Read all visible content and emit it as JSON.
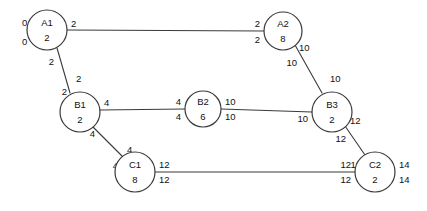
{
  "diagram": {
    "title": "",
    "type": "node-link-graph",
    "background_color": "#ffffff",
    "stroke_color": "#3a3a3a",
    "text_color": "#111111",
    "nodes": [
      {
        "id": "A1",
        "name": "A1",
        "value": "2",
        "cx": 47,
        "cy": 30,
        "r": 20
      },
      {
        "id": "A2",
        "name": "A2",
        "value": "8",
        "cx": 283,
        "cy": 31,
        "r": 19
      },
      {
        "id": "B1",
        "name": "B1",
        "value": "2",
        "cx": 80,
        "cy": 112,
        "r": 20
      },
      {
        "id": "B2",
        "name": "B2",
        "value": "6",
        "cx": 203,
        "cy": 109,
        "r": 18
      },
      {
        "id": "B3",
        "name": "B3",
        "value": "2",
        "cx": 332,
        "cy": 112,
        "r": 20
      },
      {
        "id": "C1",
        "name": "C1",
        "value": "8",
        "cx": 135,
        "cy": 172,
        "r": 20
      },
      {
        "id": "C2",
        "name": "C2",
        "value": "2",
        "cx": 375,
        "cy": 172,
        "r": 20
      }
    ],
    "edges": [
      {
        "id": "A1-A2",
        "from": "A1",
        "to": "A2",
        "x1": 67,
        "y1": 30,
        "x2": 264,
        "y2": 31,
        "labels": [
          {
            "text": "2",
            "x": 71,
            "y": 24,
            "anchor": "start"
          },
          {
            "text": "2",
            "x": 260,
            "y": 24,
            "anchor": "end"
          },
          {
            "text": "2",
            "x": 260,
            "y": 40,
            "anchor": "end"
          }
        ]
      },
      {
        "id": "A1-B1",
        "from": "A1",
        "to": "B1",
        "x1": 57,
        "y1": 48,
        "x2": 70,
        "y2": 93,
        "labels": [
          {
            "text": "2",
            "x": 54,
            "y": 62,
            "anchor": "end"
          },
          {
            "text": "2",
            "x": 76,
            "y": 79,
            "anchor": "start"
          },
          {
            "text": "2",
            "x": 67,
            "y": 92,
            "anchor": "end"
          }
        ]
      },
      {
        "id": "A2-B3",
        "from": "A2",
        "to": "B3",
        "x1": 295,
        "y1": 45,
        "x2": 322,
        "y2": 93,
        "labels": [
          {
            "text": "10",
            "x": 299,
            "y": 48,
            "anchor": "start"
          },
          {
            "text": "10",
            "x": 297,
            "y": 63,
            "anchor": "end"
          },
          {
            "text": "10",
            "x": 330,
            "y": 79,
            "anchor": "start"
          }
        ]
      },
      {
        "id": "B1-B2",
        "from": "B1",
        "to": "B2",
        "x1": 100,
        "y1": 110,
        "x2": 185,
        "y2": 109,
        "labels": [
          {
            "text": "4",
            "x": 104,
            "y": 103,
            "anchor": "start"
          },
          {
            "text": "4",
            "x": 181,
            "y": 102,
            "anchor": "end"
          },
          {
            "text": "4",
            "x": 181,
            "y": 117,
            "anchor": "end"
          }
        ]
      },
      {
        "id": "B2-B3",
        "from": "B2",
        "to": "B3",
        "x1": 221,
        "y1": 109,
        "x2": 312,
        "y2": 112,
        "labels": [
          {
            "text": "10",
            "x": 225,
            "y": 102,
            "anchor": "start"
          },
          {
            "text": "10",
            "x": 225,
            "y": 117,
            "anchor": "start"
          },
          {
            "text": "10",
            "x": 308,
            "y": 119,
            "anchor": "end"
          }
        ]
      },
      {
        "id": "B1-C1",
        "from": "B1",
        "to": "C1",
        "x1": 93,
        "y1": 127,
        "x2": 123,
        "y2": 157,
        "labels": [
          {
            "text": "4",
            "x": 95,
            "y": 134,
            "anchor": "end"
          },
          {
            "text": "4",
            "x": 127,
            "y": 150,
            "anchor": "start"
          },
          {
            "text": "4",
            "x": 118,
            "y": 166,
            "anchor": "end"
          }
        ]
      },
      {
        "id": "B3-C2",
        "from": "B3",
        "to": "C2",
        "x1": 345,
        "y1": 126,
        "x2": 365,
        "y2": 155,
        "labels": [
          {
            "text": "12",
            "x": 350,
            "y": 121,
            "anchor": "start"
          },
          {
            "text": "12",
            "x": 346,
            "y": 139,
            "anchor": "end"
          },
          {
            "text": "12",
            "x": 361,
            "y": 165,
            "anchor": "end"
          }
        ]
      },
      {
        "id": "C1-C2",
        "from": "C1",
        "to": "C2",
        "x1": 155,
        "y1": 172,
        "x2": 355,
        "y2": 172,
        "labels": [
          {
            "text": "12",
            "x": 159,
            "y": 165,
            "anchor": "start"
          },
          {
            "text": "12",
            "x": 159,
            "y": 180,
            "anchor": "start"
          },
          {
            "text": "12",
            "x": 351,
            "y": 165,
            "anchor": "end"
          },
          {
            "text": "12",
            "x": 351,
            "y": 180,
            "anchor": "end"
          }
        ]
      }
    ],
    "free_labels": [
      {
        "id": "a1-left-top",
        "text": "0",
        "x": 22,
        "y": 23,
        "anchor": "start"
      },
      {
        "id": "a1-left-bottom",
        "text": "0",
        "x": 22,
        "y": 42,
        "anchor": "start"
      },
      {
        "id": "c2-right-top",
        "text": "14",
        "x": 399,
        "y": 165,
        "anchor": "start"
      },
      {
        "id": "c2-right-bottom",
        "text": "14",
        "x": 399,
        "y": 180,
        "anchor": "start"
      }
    ]
  }
}
